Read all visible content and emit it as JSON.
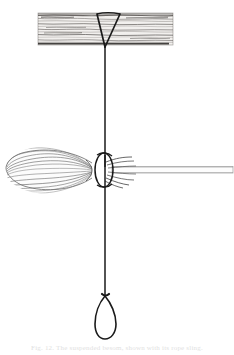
{
  "figure": {
    "caption": "Fig. 12.  The suspended besom, shown with its rope sling.",
    "background_color": "#ffffff",
    "ink_color": "#1a1a1a",
    "grain_color": "#555555",
    "bristle_color": "#8f8f8f",
    "handle_outline_color": "#a8a8a8",
    "caption_color": "#c8c8c8"
  },
  "parts": {
    "beam": {
      "label": "wooden beam",
      "x": 38,
      "y": 13,
      "width": 135,
      "height": 32,
      "grain_line_count": 16
    },
    "v_sling": {
      "label": "v-shaped rope sling",
      "left_x": 97,
      "right_x": 120,
      "top_y": 14,
      "apex_x": 105,
      "apex_y": 47
    },
    "upper_rope": {
      "label": "upper suspension rope",
      "x": 105,
      "top_y": 47,
      "bottom_y": 166
    },
    "broom_head": {
      "label": "besom bristle head",
      "left_tip_x": 6,
      "right_x": 92,
      "center_y": 170,
      "max_half_height": 23,
      "bristle_count": 13
    },
    "binding_loop": {
      "label": "rope binding loop around broom",
      "center_x": 104,
      "center_y": 170,
      "radius_x": 9,
      "radius_y": 17
    },
    "twig_ends": {
      "label": "protruding twig ends",
      "count": 7
    },
    "handle": {
      "label": "broom handle",
      "left_x": 112,
      "right_x": 233,
      "top_y": 166,
      "height": 7
    },
    "lower_rope": {
      "label": "lower suspension rope",
      "x": 105,
      "top_y": 170,
      "bottom_y": 296
    },
    "bottom_loop": {
      "label": "teardrop rope loop",
      "center_x": 105,
      "top_y": 296,
      "bottom_y": 339,
      "max_half_width": 11
    }
  }
}
